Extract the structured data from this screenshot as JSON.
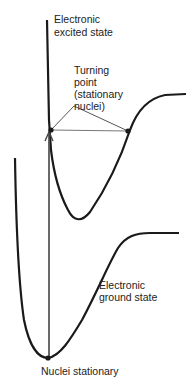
{
  "labels": {
    "excited_state": [
      "Electronic",
      "excited state"
    ],
    "turning_point": [
      "Turning",
      "point",
      "(stationary",
      "nuclei)"
    ],
    "ground_state": [
      "Electronic",
      "ground state"
    ],
    "nuclei_stationary": "Nuclei stationary"
  },
  "colors": {
    "curve": "#1a1a1a",
    "pointer": "#555555",
    "text": "#222222"
  }
}
